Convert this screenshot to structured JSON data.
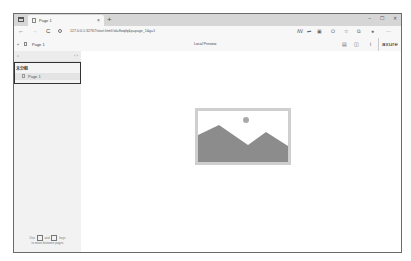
{
  "browser": {
    "tab": {
      "title": "Page 1",
      "close": "×"
    },
    "new_tab": "+",
    "window_controls": {
      "minimize": "–",
      "maximize": "☐",
      "close": "✕"
    },
    "nav": {
      "back": "←",
      "forward": "→",
      "refresh": "C"
    },
    "url": "127.0.0.1:32767/start.html#id=8wqfq&p=page_1&g=1",
    "toolbar_icons": [
      "read-aloud",
      "translate",
      "apps",
      "refresh-ext",
      "favorites",
      "collections",
      "profile",
      "more"
    ],
    "toolbar_glyphs": {
      "read_aloud": "ꟿ",
      "translate": "⇌",
      "apps": "▣",
      "ext": "⭘",
      "favorites": "☆",
      "collections": "⧉",
      "profile": "●",
      "more": "···"
    }
  },
  "axure_toolbar": {
    "collapse_glyph": "«",
    "page_name": "Page 1",
    "center_label": "Local Preview",
    "buttons": {
      "sitemap": "▤",
      "layout": "◫",
      "info": "i"
    },
    "logo": "axure"
  },
  "sidebar": {
    "search_glyph": "⌕",
    "arrows": "‹ ›",
    "folder": "未分组",
    "pages": [
      {
        "label": "Page 1"
      }
    ],
    "hint": {
      "use": "Use",
      "and": "and",
      "keys": "keys",
      "line2": "to move between pages"
    }
  },
  "main": {
    "placeholder": {
      "frame_color": "#cfcfcf",
      "mountain_color": "#8c8c8c",
      "sun_color": "#a9a9a9"
    }
  }
}
